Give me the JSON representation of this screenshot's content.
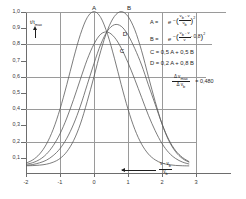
{
  "chart_data": {
    "type": "line",
    "title": "",
    "xlabel": "(v - v_b)/v_b",
    "ylabel": "t/t_max",
    "xlim": [
      -2,
      3
    ],
    "ylim": [
      0,
      1.05
    ],
    "grid": true,
    "legend_position": "right",
    "x_ticks": [
      "-2",
      "-1",
      "0",
      "1",
      "2",
      "3"
    ],
    "y_ticks": [
      "0,1",
      "0,2",
      "0,3",
      "0,4",
      "0,5",
      "0,6",
      "0,7",
      "0,8",
      "0,9",
      "1,0"
    ],
    "gridlines": {
      "x": [
        -1,
        0,
        1,
        2,
        3
      ],
      "y": [
        0.2,
        0.4,
        0.6,
        0.8,
        1.0
      ]
    },
    "x": [
      -2.0,
      -1.8,
      -1.6,
      -1.4,
      -1.2,
      -1.0,
      -0.8,
      -0.6,
      -0.4,
      -0.2,
      0.0,
      0.2,
      0.4,
      0.6,
      0.8,
      1.0,
      1.2,
      1.4,
      1.6,
      1.8,
      2.0,
      2.2,
      2.4,
      2.6,
      2.8
    ],
    "series": [
      {
        "name": "A",
        "label": "A",
        "peak_x": 0.0,
        "peak_y": 1.0,
        "values": [
          0.018,
          0.039,
          0.077,
          0.141,
          0.237,
          0.368,
          0.527,
          0.698,
          0.852,
          0.961,
          1.0,
          0.961,
          0.852,
          0.698,
          0.527,
          0.368,
          0.237,
          0.141,
          0.077,
          0.039,
          0.018,
          0.008,
          0.003,
          0.001,
          0.0
        ]
      },
      {
        "name": "B",
        "label": "B",
        "peak_x": 0.8,
        "peak_y": 1.0,
        "values": [
          0.001,
          0.002,
          0.005,
          0.011,
          0.024,
          0.048,
          0.092,
          0.164,
          0.272,
          0.417,
          0.579,
          0.746,
          0.882,
          0.969,
          1.0,
          0.969,
          0.882,
          0.746,
          0.579,
          0.417,
          0.272,
          0.164,
          0.092,
          0.048,
          0.024
        ]
      },
      {
        "name": "C",
        "label": "C",
        "peak_x": 0.4,
        "peak_y": 0.862,
        "values": [
          0.01,
          0.021,
          0.041,
          0.076,
          0.131,
          0.208,
          0.31,
          0.431,
          0.562,
          0.689,
          0.79,
          0.854,
          0.867,
          0.834,
          0.764,
          0.669,
          0.56,
          0.444,
          0.328,
          0.228,
          0.145,
          0.086,
          0.048,
          0.025,
          0.012
        ]
      },
      {
        "name": "D",
        "label": "D",
        "peak_x": 0.6,
        "peak_y": 0.925,
        "values": [
          0.004,
          0.009,
          0.02,
          0.037,
          0.067,
          0.112,
          0.179,
          0.271,
          0.388,
          0.526,
          0.664,
          0.789,
          0.876,
          0.915,
          0.905,
          0.849,
          0.76,
          0.654,
          0.525,
          0.399,
          0.273,
          0.17,
          0.099,
          0.055,
          0.027
        ]
      }
    ],
    "annotations": [
      {
        "id": "ratio",
        "numerator": "Δ v",
        "numerator_sub": "max",
        "denominator": "Δ v",
        "denominator_sub": "b",
        "value": "0,480",
        "equals": "="
      }
    ]
  },
  "y_axis": {
    "caption_main": "t",
    "caption_slash": "/",
    "caption_den": "t",
    "caption_den_sub": "max",
    "labels": [
      "1,0",
      "0,9",
      "0,8",
      "0,7",
      "0,6",
      "0,5",
      "0,4",
      "0,3",
      "0,2",
      "0,1"
    ],
    "arrow_icon": "arrow-up-icon"
  },
  "x_axis": {
    "labels": [
      "-2",
      "-1",
      "0",
      "1",
      "2",
      "3"
    ],
    "caption_num": "v - v",
    "caption_num_sub": "b",
    "caption_den": "v",
    "caption_den_sub": "b",
    "arrow_icon": "arrow-right-icon"
  },
  "curve_labels": [
    {
      "name": "A",
      "text": "A"
    },
    {
      "name": "B",
      "text": "B"
    },
    {
      "name": "C",
      "text": "C"
    },
    {
      "name": "D",
      "text": "D"
    }
  ],
  "legend": {
    "eq_a": {
      "lhs": "A  =",
      "base": "e",
      "paren_open": "(",
      "paren_close": ")",
      "minus": "−",
      "num": "v",
      "num_sub": "b",
      "num_rest": " - v",
      "den": "v",
      "den_sub": "b",
      "exp": "2"
    },
    "eq_b": {
      "lhs": "B  =",
      "base": "e",
      "paren_open": "(",
      "paren_close": ")",
      "minus": "−",
      "num": "v",
      "num_sub": "b",
      "num_rest": " - v",
      "den": "v",
      "den_sub": "",
      "offset": "- 0,8",
      "exp": "2"
    },
    "eq_c": "C  =  0,5 A  +  0,5 B",
    "eq_d": "D  =  0,2 A  +  0,8 B"
  }
}
